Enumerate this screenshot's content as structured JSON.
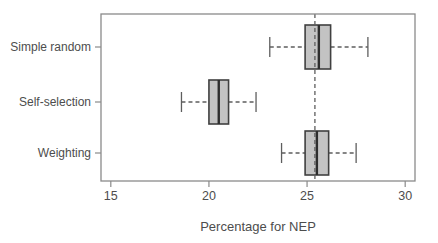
{
  "chart_data": {
    "type": "boxplot",
    "orientation": "horizontal",
    "title": "",
    "xlabel": "Percentage for NEP",
    "ylabel": "",
    "xlim": [
      14.5,
      30.5
    ],
    "x_ticks": [
      15,
      20,
      25,
      30
    ],
    "grid": false,
    "legend": "none",
    "reference_line_x": 25.4,
    "reference_line_style": "dashed",
    "categories": [
      "Simple random",
      "Self-selection",
      "Weighting"
    ],
    "boxes": [
      {
        "label": "Simple random",
        "whisker_low": 23.1,
        "q1": 24.9,
        "median": 25.6,
        "q3": 26.2,
        "whisker_high": 28.1
      },
      {
        "label": "Self-selection",
        "whisker_low": 18.6,
        "q1": 20.0,
        "median": 20.5,
        "q3": 21.0,
        "whisker_high": 22.4
      },
      {
        "label": "Weighting",
        "whisker_low": 23.7,
        "q1": 24.9,
        "median": 25.5,
        "q3": 26.1,
        "whisker_high": 27.5
      }
    ],
    "colors": {
      "background": "#ffffff",
      "box_fill": "#c3c3c3",
      "box_border": "#404040",
      "median": "#2e2e2e",
      "whisker": "#5e5e5e",
      "reference_line": "#5e5e5e",
      "axis": "#8a8a8a",
      "text": "#4d4d4d"
    }
  }
}
